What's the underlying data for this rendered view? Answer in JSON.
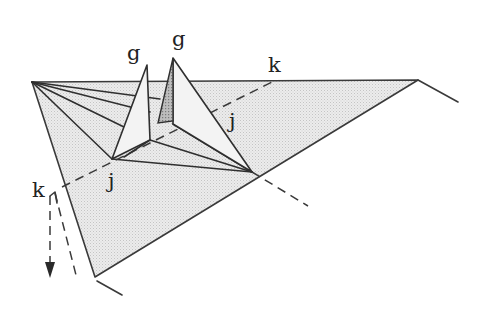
{
  "diagram": {
    "type": "origami-fold-step",
    "labels": {
      "g_left": "g",
      "g_right": "g",
      "k_top": "k",
      "k_left": "k",
      "j_left": "j",
      "j_right": "j"
    },
    "colors": {
      "line": "#3a3a3a",
      "paper_fill": "#e4e4e4",
      "background": "#ffffff"
    },
    "annotations": {
      "fold_line": "dashed valley fold k–k",
      "arrow": "dashed arrow pointing down at left k"
    }
  }
}
